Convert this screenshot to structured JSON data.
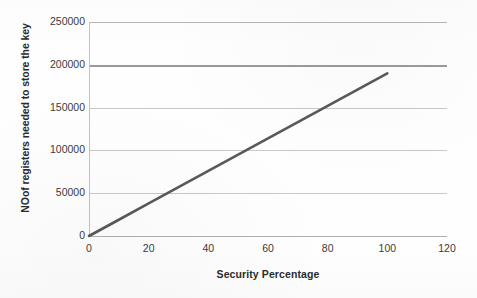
{
  "chart_data": {
    "type": "line",
    "title": "",
    "xlabel": "Security Percentage",
    "ylabel": "NOof registers needed to store the key",
    "xlim": [
      0,
      120
    ],
    "ylim": [
      0,
      250000
    ],
    "x_ticks": [
      "0",
      "20",
      "40",
      "60",
      "80",
      "100",
      "120"
    ],
    "x_tick_values": [
      0,
      20,
      40,
      60,
      80,
      100,
      120
    ],
    "y_ticks": [
      "0",
      "50000",
      "100000",
      "150000",
      "200000",
      "250000"
    ],
    "y_tick_values": [
      0,
      50000,
      100000,
      150000,
      200000,
      250000
    ],
    "grid": true,
    "grid_axis": "y",
    "legend": false,
    "series": [
      {
        "name": "Registers vs Security Percentage",
        "color": "#595959",
        "x": [
          0,
          10,
          20,
          30,
          40,
          50,
          60,
          70,
          80,
          90,
          100
        ],
        "values": [
          0,
          19000,
          38000,
          57000,
          76000,
          95000,
          114000,
          133000,
          152000,
          171000,
          190000
        ]
      }
    ]
  },
  "axes": {
    "y_title": "NOof registers needed to store the key",
    "x_title": "Security Percentage"
  },
  "colors": {
    "series_line": "#595959",
    "gridline": "#c8c8c8",
    "gridline_major": "#9a9a9a",
    "background": "#fefefe",
    "tick_text": "#3a3a3a"
  }
}
